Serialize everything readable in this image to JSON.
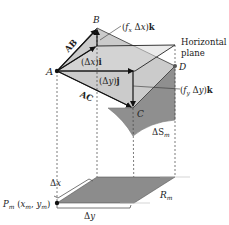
{
  "figure": {
    "points": {
      "A": "A",
      "B": "B",
      "C": "C",
      "D": "D",
      "P": "P",
      "P_sub": "m",
      "P_coords_open": " (",
      "P_x": "x",
      "P_y": "y",
      "P_close": ")"
    },
    "vectors": {
      "AB": "AB",
      "AC": "AC",
      "dx_i": "(Δx)i",
      "dy_j": "(Δy)j",
      "fx_dx_k": "(fxΔx)k",
      "fy_dy_k": "(fyΔy)k"
    },
    "labels": {
      "horizontal_plane_line1": "Horizontal",
      "horizontal_plane_line2": "plane",
      "surface_patch": "ΔS",
      "surface_patch_sub": "m",
      "region": "R",
      "region_sub": "m",
      "delta_x": "Δx",
      "delta_y": "Δy"
    },
    "colors": {
      "tilted_plane": "#c8c8c8",
      "horizontal_plane": "#d6d6d6",
      "surface": "#8f8f8f",
      "region": "#8c8c8c",
      "lines": "#222222"
    }
  }
}
